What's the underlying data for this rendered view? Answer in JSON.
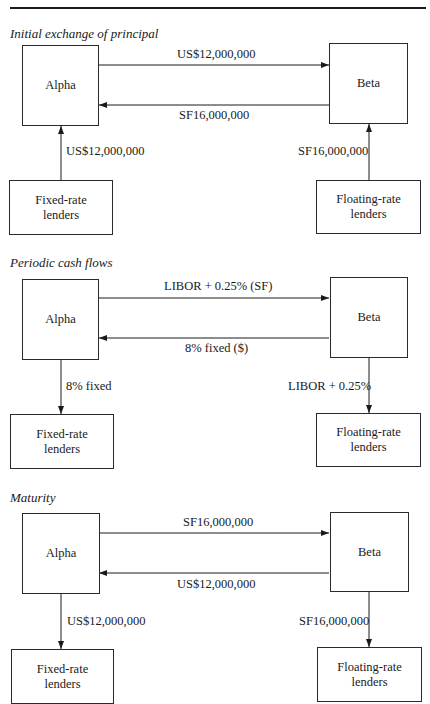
{
  "sections": [
    {
      "title": "Initial exchange of principal",
      "nodes": {
        "alpha": "Alpha",
        "beta": "Beta",
        "fixed": "Fixed-rate lenders",
        "fixed_l1": "Fixed-rate",
        "fixed_l2": "lenders",
        "floating_l1": "Floating-rate",
        "floating_l2": "lenders"
      },
      "flows": {
        "alpha_to_beta": "US$12,000,000",
        "beta_to_alpha": "SF16,000,000",
        "fixed_alpha": "US$12,000,000",
        "floating_beta": "SF16,000,000"
      }
    },
    {
      "title": "Periodic cash flows",
      "nodes": {
        "alpha": "Alpha",
        "beta": "Beta",
        "fixed_l1": "Fixed-rate",
        "fixed_l2": "lenders",
        "floating_l1": "Floating-rate",
        "floating_l2": "lenders"
      },
      "flows": {
        "alpha_to_beta": "LIBOR + 0.25% (SF)",
        "beta_to_alpha": "8% fixed ($)",
        "fixed_alpha": "8% fixed",
        "floating_beta": "LIBOR + 0.25%"
      }
    },
    {
      "title": "Maturity",
      "nodes": {
        "alpha": "Alpha",
        "beta": "Beta",
        "fixed_l1": "Fixed-rate",
        "fixed_l2": "lenders",
        "floating_l1": "Floating-rate",
        "floating_l2": "lenders"
      },
      "flows": {
        "alpha_to_beta": "SF16,000,000",
        "beta_to_alpha": "US$12,000,000",
        "fixed_alpha": "US$12,000,000",
        "floating_beta": "SF16,000,000"
      }
    }
  ]
}
